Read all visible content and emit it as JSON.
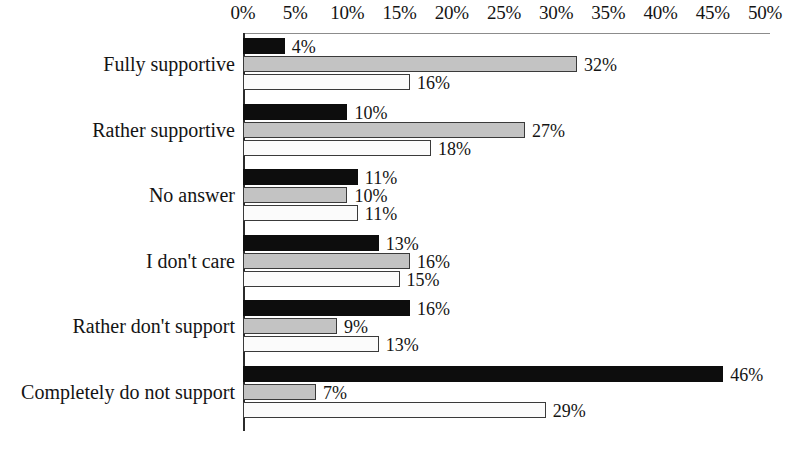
{
  "chart_data": {
    "type": "bar",
    "orientation": "horizontal",
    "title": "",
    "subtitle": "",
    "xlabel": "",
    "ylabel": "",
    "xlim": [
      0,
      50
    ],
    "xtick_labels": [
      "0%",
      "5%",
      "10%",
      "15%",
      "20%",
      "25%",
      "30%",
      "35%",
      "40%",
      "45%",
      "50%"
    ],
    "xticks": [
      0,
      5,
      10,
      15,
      20,
      25,
      30,
      35,
      40,
      45,
      50
    ],
    "grid": false,
    "legend": "none",
    "value_label_suffix": "%",
    "categories": [
      "Fully supportive",
      "Rather supportive",
      "No answer",
      "I don't care",
      "Rather don't support",
      "Completely do not support"
    ],
    "series": [
      {
        "name": "series-1",
        "color": "#0d0d0d",
        "values": [
          4,
          10,
          11,
          13,
          16,
          46
        ],
        "value_labels": [
          "4%",
          "10%",
          "11%",
          "13%",
          "16%",
          "46%"
        ]
      },
      {
        "name": "series-2",
        "color": "#c3c3c3",
        "values": [
          32,
          27,
          10,
          16,
          9,
          7
        ],
        "value_labels": [
          "32%",
          "27%",
          "10%",
          "16%",
          "9%",
          "7%"
        ]
      },
      {
        "name": "series-3",
        "color": "#fbfbfb",
        "values": [
          16,
          18,
          11,
          15,
          13,
          29
        ],
        "value_labels": [
          "16%",
          "18%",
          "11%",
          "15%",
          "13%",
          "29%"
        ]
      }
    ]
  },
  "axis": {
    "line_color": "#2b2b2b"
  }
}
